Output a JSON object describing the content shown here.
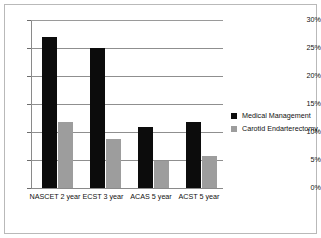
{
  "chart_data": {
    "type": "bar",
    "title": "",
    "subtitle": "",
    "xlabel": "",
    "ylabel": "",
    "categories": [
      "NASCET 2 year",
      "ECST 3 year",
      "ACAS 5 year",
      "ACST 5 year"
    ],
    "series": [
      {
        "name": "Medical Management",
        "color": "#0c0c0c",
        "values": [
          26.9,
          25.0,
          10.9,
          11.7
        ]
      },
      {
        "name": "Carotid Endarterectomy",
        "color": "#9d9d9d",
        "values": [
          11.8,
          8.8,
          4.9,
          5.8
        ]
      }
    ],
    "ylim": [
      0,
      30
    ],
    "y_ticks": [
      0,
      5,
      10,
      15,
      20,
      25,
      30
    ],
    "y_tick_labels": [
      "0%",
      "5%",
      "10%",
      "15%",
      "20%",
      "25%",
      "30%"
    ],
    "grid": true,
    "legend_position": "right"
  },
  "legend": {
    "entries": [
      {
        "label": "Medical Management"
      },
      {
        "label": "Carotid Endarterectomy"
      }
    ]
  }
}
